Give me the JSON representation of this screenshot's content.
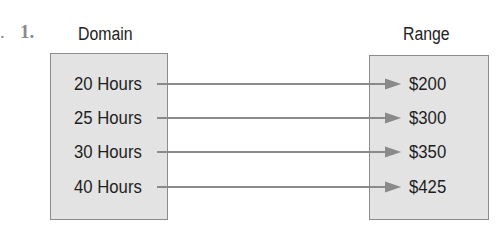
{
  "problem": {
    "number": "1.",
    "prefix": "."
  },
  "diagram": {
    "type": "mapping",
    "domain_label": "Domain",
    "range_label": "Range",
    "domain": [
      "20 Hours",
      "25 Hours",
      "30 Hours",
      "40 Hours"
    ],
    "range": [
      "$200",
      "$300",
      "$350",
      "$425"
    ],
    "mappings": [
      {
        "from": "20 Hours",
        "to": "$200"
      },
      {
        "from": "25 Hours",
        "to": "$300"
      },
      {
        "from": "30 Hours",
        "to": "$350"
      },
      {
        "from": "40 Hours",
        "to": "$425"
      }
    ],
    "colors": {
      "box_fill": "#e3e3e3",
      "box_border": "#8c8c8c",
      "arrow": "#8a8a8a"
    }
  }
}
